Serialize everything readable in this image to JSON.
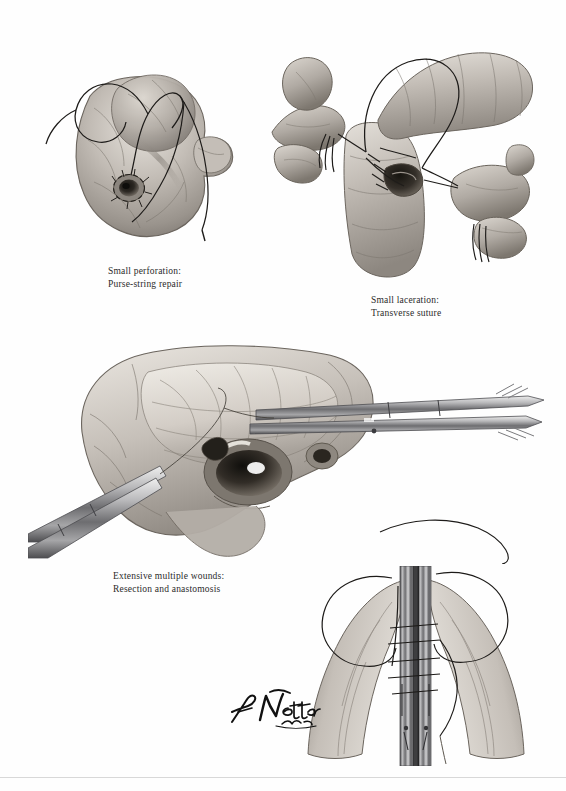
{
  "page": {
    "background_color": "#fefefe",
    "artist_signature": "F. Netter M.D.",
    "footer_note": ""
  },
  "captions": [
    {
      "id": "small-perforation",
      "line1": "Small perforation:",
      "line2": "Purse-string repair",
      "text": "Small perforation:\nPurse-string repair"
    },
    {
      "id": "small-laceration",
      "line1": "Small laceration:",
      "line2": "Transverse suture",
      "text": "Small laceration:\nTransverse suture"
    },
    {
      "id": "extensive-wounds",
      "line1": "Extensive multiple wounds:",
      "line2": "Resection and anastomosis",
      "text": "Extensive multiple wounds:\nResection and anastomosis"
    }
  ],
  "figures": [
    {
      "id": "figure-purse-string",
      "label": "Duodenum with small perforation and purse-string suture",
      "elements": [
        "duodenum",
        "perforation",
        "purse-string-suture",
        "needle",
        "suture-thread"
      ]
    },
    {
      "id": "figure-transverse-suture",
      "label": "Surgeon's hands placing transverse suture across small laceration",
      "elements": [
        "surgeon-hands",
        "duodenum",
        "laceration",
        "stay-sutures",
        "suture-loop"
      ]
    },
    {
      "id": "figure-resection",
      "label": "Extensive multiple wounds of duodenum with clamps applied for resection",
      "elements": [
        "duodenum",
        "mesentery",
        "multiple-perforations",
        "surgical-clamps",
        "suture-thread"
      ]
    },
    {
      "id": "figure-anastomosis",
      "label": "End-to-end anastomosis between clamped bowel ends with interrupted sutures",
      "elements": [
        "bowel-ends",
        "clamps",
        "interrupted-sutures",
        "suture-thread"
      ]
    }
  ],
  "colors": {
    "ink": "#2b2b2b",
    "paper": "#fefefe",
    "rule": "#d8d8d8",
    "tissue_light": "#cfcac4",
    "tissue_mid": "#a49d96",
    "tissue_dark": "#6f6962",
    "shadow": "#4a453f",
    "suture": "#1d1b19",
    "steel_light": "#c9c9c9",
    "steel_dark": "#58585a",
    "highlight": "#f2efe9"
  }
}
